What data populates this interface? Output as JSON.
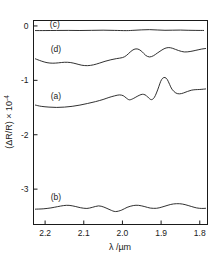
{
  "figure": {
    "title": "",
    "xaxis_title": "λ /µm",
    "yaxis_title": "(ΔR/R) × 10",
    "yaxis_exponent": "-4",
    "line_color": "#1a1a1a",
    "background": "#ffffff"
  },
  "chart_data": {
    "type": "line",
    "title": "",
    "xlabel": "λ /µm",
    "ylabel": "(ΔR/R) × 10^-4",
    "xlim": [
      2.23,
      1.78
    ],
    "ylim": [
      -3.65,
      0.1
    ],
    "x_reversed": true,
    "grid": false,
    "legend": "inline-labels",
    "xticks": [
      2.2,
      2.1,
      2.0,
      1.9,
      1.8
    ],
    "xtick_labels": [
      "2.2",
      "2.1",
      "2.0",
      "1.9",
      "1.8"
    ],
    "yticks": [
      0,
      -1,
      -2,
      -3
    ],
    "ytick_labels": [
      "0",
      "-1",
      "-2",
      "-3"
    ],
    "series": [
      {
        "name": "(c)",
        "label": "(c)",
        "label_x": 2.175,
        "label_y": -0.02,
        "x": [
          2.225,
          2.2,
          2.17,
          2.14,
          2.11,
          2.08,
          2.05,
          2.02,
          1.99,
          1.97,
          1.95,
          1.93,
          1.91,
          1.89,
          1.87,
          1.85,
          1.83,
          1.81,
          1.79
        ],
        "y": [
          -0.085,
          -0.085,
          -0.083,
          -0.082,
          -0.084,
          -0.081,
          -0.078,
          -0.082,
          -0.086,
          -0.08,
          -0.072,
          -0.068,
          -0.074,
          -0.08,
          -0.078,
          -0.076,
          -0.08,
          -0.082,
          -0.083
        ]
      },
      {
        "name": "(d)",
        "label": "(d)",
        "label_x": 2.172,
        "label_y": -0.47,
        "x": [
          2.225,
          2.21,
          2.195,
          2.18,
          2.165,
          2.15,
          2.135,
          2.12,
          2.105,
          2.09,
          2.075,
          2.06,
          2.045,
          2.03,
          2.015,
          2.0,
          1.99,
          1.98,
          1.97,
          1.96,
          1.95,
          1.94,
          1.93,
          1.92,
          1.91,
          1.9,
          1.89,
          1.88,
          1.87,
          1.855,
          1.84,
          1.825,
          1.81,
          1.795,
          1.785
        ],
        "y": [
          -0.605,
          -0.645,
          -0.675,
          -0.685,
          -0.678,
          -0.668,
          -0.672,
          -0.695,
          -0.722,
          -0.73,
          -0.715,
          -0.685,
          -0.65,
          -0.622,
          -0.6,
          -0.582,
          -0.545,
          -0.48,
          -0.43,
          -0.425,
          -0.468,
          -0.54,
          -0.57,
          -0.548,
          -0.5,
          -0.452,
          -0.412,
          -0.398,
          -0.412,
          -0.452,
          -0.478,
          -0.47,
          -0.448,
          -0.425,
          -0.415
        ]
      },
      {
        "name": "(a)",
        "label": "(a)",
        "label_x": 2.172,
        "label_y": -1.34,
        "x": [
          2.225,
          2.21,
          2.19,
          2.17,
          2.15,
          2.13,
          2.11,
          2.09,
          2.07,
          2.05,
          2.035,
          2.02,
          2.008,
          1.998,
          1.99,
          1.982,
          1.972,
          1.962,
          1.952,
          1.945,
          1.938,
          1.932,
          1.925,
          1.918,
          1.912,
          1.906,
          1.901,
          1.896,
          1.89,
          1.884,
          1.878,
          1.872,
          1.862,
          1.852,
          1.842,
          1.832,
          1.822,
          1.812,
          1.8,
          1.79,
          1.785
        ],
        "y": [
          -1.455,
          -1.478,
          -1.492,
          -1.498,
          -1.492,
          -1.478,
          -1.455,
          -1.425,
          -1.392,
          -1.352,
          -1.315,
          -1.285,
          -1.268,
          -1.282,
          -1.325,
          -1.358,
          -1.335,
          -1.295,
          -1.262,
          -1.258,
          -1.282,
          -1.325,
          -1.355,
          -1.32,
          -1.232,
          -1.118,
          -1.018,
          -0.962,
          -0.948,
          -0.985,
          -1.075,
          -1.162,
          -1.232,
          -1.248,
          -1.232,
          -1.205,
          -1.182,
          -1.172,
          -1.168,
          -1.162,
          -1.158
        ]
      },
      {
        "name": "(b)",
        "label": "(b)",
        "label_x": 2.172,
        "label_y": -3.2,
        "x": [
          2.225,
          2.205,
          2.185,
          2.168,
          2.152,
          2.138,
          2.122,
          2.108,
          2.092,
          2.078,
          2.062,
          2.048,
          2.032,
          2.018,
          2.002,
          1.988,
          1.972,
          1.958,
          1.942,
          1.928,
          1.912,
          1.898,
          1.882,
          1.868,
          1.852,
          1.838,
          1.822,
          1.808,
          1.795,
          1.785
        ],
        "y": [
          -3.368,
          -3.362,
          -3.345,
          -3.322,
          -3.302,
          -3.298,
          -3.318,
          -3.342,
          -3.355,
          -3.335,
          -3.308,
          -3.33,
          -3.38,
          -3.412,
          -3.385,
          -3.335,
          -3.302,
          -3.298,
          -3.322,
          -3.348,
          -3.352,
          -3.33,
          -3.295,
          -3.272,
          -3.268,
          -3.285,
          -3.318,
          -3.345,
          -3.355,
          -3.352
        ]
      }
    ]
  }
}
